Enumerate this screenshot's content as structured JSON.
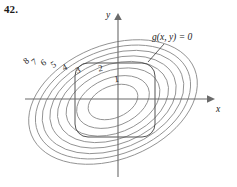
{
  "figure": {
    "exercise_number": "42.",
    "axes": {
      "x_label": "x",
      "y_label": "y"
    },
    "constraint": {
      "label": "g(x, y) = 0"
    },
    "chart_data": {
      "type": "line",
      "title": "",
      "subtitle": "",
      "xlabel": "x",
      "ylabel": "y",
      "grid": false,
      "legend": "none",
      "description": "Contour map of a function f with eight nested tilted elliptical level curves labeled 1 through 8 increasing outward, together with a closed rounded-square constraint curve g(x, y) = 0 superimposed.",
      "annotations": [
        "g(x, y) = 0"
      ],
      "contour_labels": [
        "1",
        "2",
        "3",
        "4",
        "5",
        "6",
        "7",
        "8"
      ],
      "contour_levels": [
        1,
        2,
        3,
        4,
        5,
        6,
        7,
        8
      ],
      "series": [
        {
          "name": "level curve 1",
          "level": 1,
          "label": "1",
          "kind": "ellipse",
          "center_x": -5,
          "center_y": -3,
          "rx": 26,
          "ry": 16,
          "rotation_deg": -22,
          "label_x": 117,
          "label_y": 82
        },
        {
          "name": "level curve 2",
          "level": 2,
          "label": "2",
          "kind": "ellipse",
          "center_x": -5,
          "center_y": -3,
          "rx": 38,
          "ry": 24,
          "rotation_deg": -22,
          "label_x": 101,
          "label_y": 71
        },
        {
          "name": "level curve 3",
          "level": 3,
          "label": "3",
          "kind": "ellipse",
          "center_x": -5,
          "center_y": -3,
          "rx": 49,
          "ry": 31,
          "rotation_deg": -22,
          "label_x": 79,
          "label_y": 73
        },
        {
          "name": "level curve 4",
          "level": 4,
          "label": "4",
          "kind": "ellipse",
          "center_x": -5,
          "center_y": -3,
          "rx": 58,
          "ry": 37,
          "rotation_deg": -22,
          "label_x": 66,
          "label_y": 70
        },
        {
          "name": "level curve 5",
          "level": 5,
          "label": "5",
          "kind": "ellipse",
          "center_x": -5,
          "center_y": -3,
          "rx": 66,
          "ry": 42,
          "rotation_deg": -22,
          "label_x": 55,
          "label_y": 67
        },
        {
          "name": "level curve 6",
          "level": 6,
          "label": "6",
          "kind": "ellipse",
          "center_x": -5,
          "center_y": -3,
          "rx": 74,
          "ry": 47,
          "rotation_deg": -22,
          "label_x": 45,
          "label_y": 65
        },
        {
          "name": "level curve 7",
          "level": 7,
          "label": "7",
          "kind": "ellipse",
          "center_x": -5,
          "center_y": -3,
          "rx": 81,
          "ry": 52,
          "rotation_deg": -22,
          "label_x": 36,
          "label_y": 64
        },
        {
          "name": "level curve 8",
          "level": 8,
          "label": "8",
          "kind": "ellipse",
          "center_x": -5,
          "center_y": -3,
          "rx": 88,
          "ry": 57,
          "rotation_deg": -22,
          "label_x": 28,
          "label_y": 63
        },
        {
          "name": "constraint curve",
          "level": null,
          "label": "g(x, y) = 0",
          "kind": "rounded-square",
          "center_x": -3,
          "center_y": -1,
          "half_width": 40,
          "half_height": 37,
          "corner_radius": 13,
          "label_x": 152,
          "label_y": 40
        }
      ],
      "axis_origin_px": [
        118,
        99
      ],
      "xlim": [
        -94,
        95
      ],
      "ylim": [
        -79,
        62
      ]
    }
  }
}
